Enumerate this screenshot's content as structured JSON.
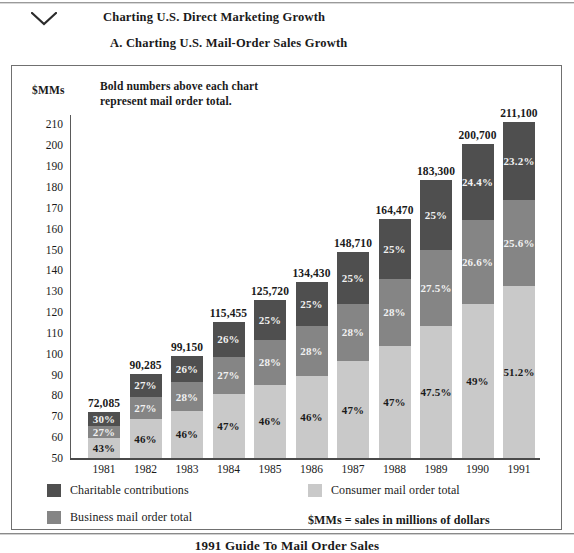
{
  "header": {
    "title": "Charting U.S. Direct Marketing Growth",
    "section": "A.  Charting U.S. Mail-Order Sales Growth",
    "chevron_icon": "chevron-down-icon"
  },
  "footer": {
    "title": "1991 Guide To Mail Order Sales"
  },
  "note": {
    "bold_numbers": "Bold numbers above each chart\nrepresent mail order total."
  },
  "legend": {
    "items": [
      {
        "label": "Charitable contributions",
        "color": "#4f4f4f"
      },
      {
        "label": "Business mail order total",
        "color": "#858585"
      },
      {
        "label": "Consumer mail order total",
        "color": "#c9c9c9"
      }
    ],
    "note": "$MMs = sales in millions of dollars"
  },
  "chart_data": {
    "type": "bar",
    "subtype": "stacked-bar",
    "title": "Charting U.S. Mail-Order Sales Growth",
    "xlabel": "",
    "ylabel": "$MMs",
    "ylim": [
      50,
      215
    ],
    "ytick_labels": [
      "210",
      "200",
      "190",
      "180",
      "170",
      "160",
      "150",
      "140",
      "130",
      "120",
      "110",
      "100",
      "90",
      "80",
      "70",
      "60",
      "50"
    ],
    "yticks": [
      210,
      200,
      190,
      180,
      170,
      160,
      150,
      140,
      130,
      120,
      110,
      100,
      90,
      80,
      70,
      60,
      50
    ],
    "grid": false,
    "legend_position": "bottom",
    "categories": [
      "1981",
      "1982",
      "1983",
      "1984",
      "1985",
      "1986",
      "1987",
      "1988",
      "1989",
      "1990",
      "1991"
    ],
    "totals": [
      "72,085",
      "90,285",
      "99,150",
      "115,455",
      "125,720",
      "134,430",
      "148,710",
      "164,470",
      "183,300",
      "200,700",
      "211,100"
    ],
    "total_values": [
      72085,
      90285,
      99150,
      115455,
      125720,
      134430,
      148710,
      164470,
      183300,
      200700,
      211100
    ],
    "series": [
      {
        "name": "Consumer mail order total",
        "color": "#c9c9c9",
        "labels": [
          "43%",
          "46%",
          "46%",
          "47%",
          "46%",
          "46%",
          "47%",
          "47%",
          "47.5%",
          "49%",
          "51.2%"
        ],
        "values": [
          43,
          46,
          46,
          47,
          46,
          46,
          47,
          47,
          47.5,
          49,
          51.2
        ]
      },
      {
        "name": "Business mail order total",
        "color": "#858585",
        "labels": [
          "27%",
          "27%",
          "28%",
          "27%",
          "28%",
          "28%",
          "28%",
          "28%",
          "27.5%",
          "26.6%",
          "25.6%"
        ],
        "values": [
          27,
          27,
          28,
          27,
          28,
          28,
          28,
          28,
          27.5,
          26.6,
          25.6
        ]
      },
      {
        "name": "Charitable contributions",
        "color": "#4f4f4f",
        "labels": [
          "30%",
          "27%",
          "26%",
          "26%",
          "25%",
          "25%",
          "25%",
          "25%",
          "25%",
          "24.4%",
          "23.2%"
        ],
        "values": [
          30,
          27,
          26,
          26,
          25,
          25,
          25,
          25,
          25,
          24.4,
          23.2
        ]
      }
    ],
    "bar_top_values": [
      72.085,
      90.285,
      99.15,
      115.455,
      125.72,
      134.43,
      148.71,
      164.47,
      183.3,
      200.7,
      211.1
    ]
  }
}
